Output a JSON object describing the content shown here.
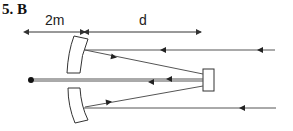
{
  "title": "5. B",
  "diagram": {
    "dimension_left_label": "2m",
    "dimension_right_label": "d",
    "elements": [
      "point-source",
      "upper-curved-mirror",
      "lower-curved-mirror",
      "plane-mirror-rectangle",
      "incoming-parallel-rays",
      "reflected-converging-rays",
      "axis-ray-through-gap"
    ]
  },
  "colors": {
    "line": "#333333",
    "background": "#ffffff"
  }
}
